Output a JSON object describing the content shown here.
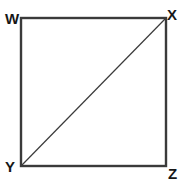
{
  "figure": {
    "shape": "square",
    "background_color": "#ffffff",
    "stroke_color": "#3a3a3a",
    "label_color": "#171717",
    "square": {
      "left": 21,
      "top": 18,
      "right": 166,
      "bottom": 166,
      "width": 145,
      "height": 148,
      "stroke_width": 2.4
    },
    "diagonal": {
      "from": "Y",
      "to": "X",
      "x1": 22,
      "y1": 165,
      "x2": 165,
      "y2": 19,
      "stroke_width": 1.2
    },
    "vertices": [
      {
        "id": "w",
        "label": "W",
        "position": "top-left"
      },
      {
        "id": "x",
        "label": "X",
        "position": "top-right"
      },
      {
        "id": "y",
        "label": "Y",
        "position": "bottom-left"
      },
      {
        "id": "z",
        "label": "Z",
        "position": "bottom-right"
      }
    ]
  }
}
